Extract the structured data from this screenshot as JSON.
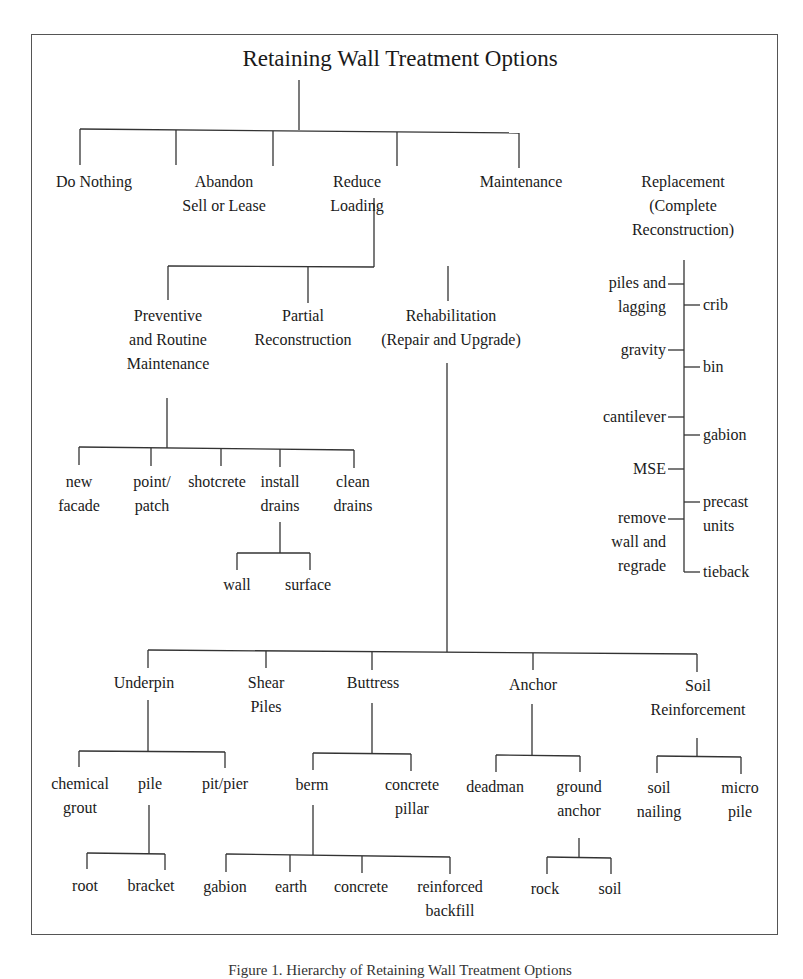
{
  "title": "Retaining Wall Treatment Options",
  "caption": "Figure 1. Hierarchy of Retaining Wall Treatment Options",
  "level1": {
    "do_nothing": "Do Nothing",
    "abandon_1": "Abandon",
    "abandon_2": "Sell or Lease",
    "reduce_1": "Reduce",
    "reduce_2": "Loading",
    "maintenance": "Maintenance",
    "replacement_1": "Replacement",
    "replacement_2": "(Complete",
    "replacement_3": "Reconstruction)"
  },
  "replacement_options": {
    "left": [
      "piles and",
      "lagging",
      "gravity",
      "cantilever",
      "MSE",
      "remove",
      "wall and",
      "regrade"
    ],
    "right": [
      "crib",
      "bin",
      "gabion",
      "precast",
      "units",
      "tieback"
    ]
  },
  "maintenance_children": {
    "preventive_1": "Preventive",
    "preventive_2": "and Routine",
    "preventive_3": "Maintenance",
    "partial_1": "Partial",
    "partial_2": "Reconstruction",
    "rehab_1": "Rehabilitation",
    "rehab_2": "(Repair and Upgrade)"
  },
  "preventive_children": {
    "new_facade_1": "new",
    "new_facade_2": "facade",
    "point_patch_1": "point/",
    "point_patch_2": "patch",
    "shotcrete": "shotcrete",
    "install_drains_1": "install",
    "install_drains_2": "drains",
    "clean_drains_1": "clean",
    "clean_drains_2": "drains",
    "wall": "wall",
    "surface": "surface"
  },
  "rehab_children": {
    "underpin": "Underpin",
    "shear_1": "Shear",
    "shear_2": "Piles",
    "buttress": "Buttress",
    "anchor": "Anchor",
    "soil_1": "Soil",
    "soil_2": "Reinforcement"
  },
  "underpin_children": {
    "chemical_1": "chemical",
    "chemical_2": "grout",
    "pile": "pile",
    "pit_pier": "pit/pier",
    "root": "root",
    "bracket": "bracket"
  },
  "buttress_children": {
    "berm": "berm",
    "concrete_pillar_1": "concrete",
    "concrete_pillar_2": "pillar",
    "gabion": "gabion",
    "earth": "earth",
    "concrete": "concrete",
    "reinforced_1": "reinforced",
    "reinforced_2": "backfill"
  },
  "anchor_children": {
    "deadman": "deadman",
    "ground_1": "ground",
    "ground_2": "anchor",
    "rock": "rock",
    "soil": "soil"
  },
  "soil_children": {
    "soil_nailing_1": "soil",
    "soil_nailing_2": "nailing",
    "micro_1": "micro",
    "micro_2": "pile"
  }
}
